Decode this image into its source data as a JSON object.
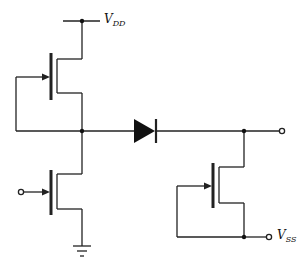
{
  "diagram": {
    "type": "circuit-schematic",
    "labels": {
      "vdd": {
        "main": "V",
        "sub": "DD"
      },
      "vss": {
        "main": "V",
        "sub": "SS"
      }
    },
    "components": [
      {
        "id": "M1",
        "kind": "PMOS transistor",
        "description": "top-left, gate tied to drain node"
      },
      {
        "id": "M2",
        "kind": "NMOS transistor",
        "description": "bottom-left, input at gate, source to ground"
      },
      {
        "id": "D1",
        "kind": "diode",
        "description": "series between left node and output"
      },
      {
        "id": "M3",
        "kind": "MOS transistor",
        "description": "right, gate tied to VSS node"
      }
    ],
    "terminals": [
      "VDD",
      "VSS",
      "input",
      "output",
      "ground"
    ],
    "colors": {
      "stroke": "#222222",
      "background": "#ffffff"
    }
  }
}
